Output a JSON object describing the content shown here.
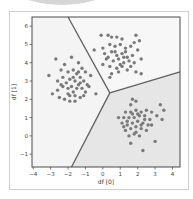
{
  "chart_data": {
    "type": "scatter",
    "title": "",
    "xlabel": "df [0]",
    "ylabel": "df [1]",
    "xlim": [
      -4.07,
      4.43
    ],
    "ylim": [
      -1.7,
      6.5
    ],
    "xticks": [
      -4,
      -3,
      -2,
      -1,
      0,
      1,
      2,
      3,
      4
    ],
    "yticks": [
      -1,
      0,
      1,
      2,
      3,
      4,
      5,
      6
    ],
    "grid": false,
    "legend": null,
    "point_color": "#7a7a7a",
    "boundary_color": "#606060",
    "region_colors": [
      "#f4f4f4",
      "#f7f7f7",
      "#e6e6e6"
    ],
    "boundaries": {
      "vertex": [
        0.4,
        2.35
      ],
      "lines": [
        {
          "from": [
            0.4,
            2.35
          ],
          "to": [
            -2.0,
            6.5
          ]
        },
        {
          "from": [
            0.4,
            2.35
          ],
          "to": [
            4.43,
            3.5
          ]
        },
        {
          "from": [
            0.4,
            2.35
          ],
          "to": [
            -1.8,
            -1.7
          ]
        }
      ]
    },
    "series": [
      {
        "name": "cluster left",
        "center": [
          -1.6,
          2.9
        ],
        "points": [
          [
            -3.1,
            3.3
          ],
          [
            -2.7,
            4.2
          ],
          [
            -2.2,
            3.9
          ],
          [
            -1.8,
            4.3
          ],
          [
            -1.4,
            4.0
          ],
          [
            -1.2,
            3.7
          ],
          [
            -1.0,
            3.5
          ],
          [
            -0.7,
            3.3
          ],
          [
            -2.4,
            3.6
          ],
          [
            -2.0,
            3.5
          ],
          [
            -1.7,
            3.6
          ],
          [
            -1.5,
            3.4
          ],
          [
            -1.3,
            3.2
          ],
          [
            -1.1,
            3.0
          ],
          [
            -0.9,
            2.8
          ],
          [
            -0.4,
            2.3
          ],
          [
            -2.9,
            2.3
          ],
          [
            -2.6,
            2.5
          ],
          [
            -2.3,
            2.7
          ],
          [
            -2.1,
            2.9
          ],
          [
            -1.9,
            3.1
          ],
          [
            -1.6,
            3.0
          ],
          [
            -1.4,
            2.8
          ],
          [
            -1.2,
            2.6
          ],
          [
            -1.0,
            2.4
          ],
          [
            -2.5,
            2.1
          ],
          [
            -2.2,
            2.0
          ],
          [
            -1.9,
            1.9
          ],
          [
            -1.6,
            1.9
          ],
          [
            -1.3,
            2.1
          ],
          [
            -2.0,
            2.3
          ],
          [
            -1.7,
            2.4
          ],
          [
            -1.5,
            2.6
          ],
          [
            -2.3,
            3.2
          ],
          [
            -1.8,
            2.7
          ],
          [
            -1.4,
            3.5
          ],
          [
            -2.6,
            3.0
          ],
          [
            -1.1,
            2.2
          ],
          [
            -0.8,
            2.7
          ],
          [
            -1.6,
            2.2
          ],
          [
            -2.0,
            2.6
          ],
          [
            -1.3,
            2.9
          ],
          [
            -2.4,
            2.8
          ],
          [
            -1.7,
            3.2
          ],
          [
            -1.9,
            2.2
          ]
        ]
      },
      {
        "name": "cluster top",
        "center": [
          1.1,
          4.4
        ],
        "points": [
          [
            -0.1,
            5.5
          ],
          [
            0.3,
            5.5
          ],
          [
            0.5,
            5.4
          ],
          [
            0.8,
            5.4
          ],
          [
            1.1,
            5.3
          ],
          [
            1.9,
            5.5
          ],
          [
            2.1,
            5.2
          ],
          [
            1.8,
            5.1
          ],
          [
            0.0,
            4.8
          ],
          [
            0.4,
            5.0
          ],
          [
            0.7,
            4.9
          ],
          [
            1.0,
            5.0
          ],
          [
            1.3,
            4.8
          ],
          [
            1.6,
            4.9
          ],
          [
            2.0,
            4.7
          ],
          [
            -0.5,
            4.7
          ],
          [
            0.1,
            4.5
          ],
          [
            0.5,
            4.6
          ],
          [
            0.8,
            4.4
          ],
          [
            1.1,
            4.5
          ],
          [
            1.4,
            4.3
          ],
          [
            1.7,
            4.4
          ],
          [
            0.2,
            4.2
          ],
          [
            0.6,
            4.1
          ],
          [
            0.9,
            4.2
          ],
          [
            1.2,
            4.0
          ],
          [
            1.5,
            4.1
          ],
          [
            1.8,
            4.0
          ],
          [
            2.2,
            4.2
          ],
          [
            0.0,
            3.9
          ],
          [
            0.4,
            3.8
          ],
          [
            0.8,
            3.7
          ],
          [
            1.1,
            3.8
          ],
          [
            1.4,
            3.6
          ],
          [
            1.9,
            3.5
          ],
          [
            2.2,
            3.4
          ],
          [
            0.5,
            3.4
          ],
          [
            0.4,
            3.2
          ],
          [
            1.0,
            3.9
          ],
          [
            0.7,
            4.6
          ],
          [
            1.3,
            4.6
          ],
          [
            0.3,
            4.3
          ],
          [
            1.6,
            3.8
          ],
          [
            0.9,
            3.5
          ],
          [
            1.2,
            4.3
          ]
        ]
      },
      {
        "name": "cluster bottom-right",
        "center": [
          1.9,
          0.9
        ],
        "points": [
          [
            1.7,
            2.0
          ],
          [
            1.9,
            1.9
          ],
          [
            1.6,
            1.7
          ],
          [
            3.3,
            1.7
          ],
          [
            3.5,
            1.4
          ],
          [
            1.3,
            1.3
          ],
          [
            1.6,
            1.3
          ],
          [
            1.9,
            1.4
          ],
          [
            2.2,
            1.3
          ],
          [
            2.5,
            1.4
          ],
          [
            2.8,
            1.3
          ],
          [
            3.1,
            1.1
          ],
          [
            3.4,
            0.9
          ],
          [
            0.9,
            1.0
          ],
          [
            1.2,
            1.0
          ],
          [
            1.5,
            1.0
          ],
          [
            1.8,
            1.0
          ],
          [
            2.1,
            1.1
          ],
          [
            2.4,
            1.1
          ],
          [
            2.7,
            0.9
          ],
          [
            1.1,
            0.7
          ],
          [
            1.4,
            0.6
          ],
          [
            1.7,
            0.7
          ],
          [
            2.0,
            0.8
          ],
          [
            2.3,
            0.7
          ],
          [
            2.6,
            0.6
          ],
          [
            1.3,
            0.3
          ],
          [
            1.6,
            0.4
          ],
          [
            1.9,
            0.5
          ],
          [
            2.2,
            0.4
          ],
          [
            2.5,
            0.3
          ],
          [
            1.5,
            0.0
          ],
          [
            1.8,
            0.1
          ],
          [
            2.1,
            0.0
          ],
          [
            1.6,
            -0.4
          ],
          [
            2.3,
            -0.8
          ],
          [
            3.0,
            -0.3
          ],
          [
            1.4,
            0.8
          ],
          [
            2.0,
            1.2
          ],
          [
            2.4,
            0.9
          ],
          [
            1.7,
            1.2
          ],
          [
            2.2,
            0.6
          ],
          [
            1.9,
            0.2
          ],
          [
            2.8,
            0.6
          ],
          [
            1.2,
            0.5
          ]
        ]
      }
    ]
  }
}
